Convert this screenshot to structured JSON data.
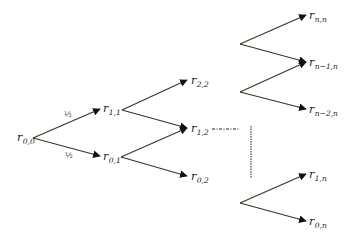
{
  "diagram": {
    "nodes": [
      {
        "id": "r00",
        "base": "r",
        "sub": "0,0",
        "x": 17,
        "y": 141
      },
      {
        "id": "r11",
        "base": "r",
        "sub": "1,1",
        "x": 103,
        "y": 112
      },
      {
        "id": "r01",
        "base": "r",
        "sub": "0,1",
        "x": 103,
        "y": 160
      },
      {
        "id": "r22",
        "base": "r",
        "sub": "2,2",
        "x": 191,
        "y": 84
      },
      {
        "id": "r12",
        "base": "r",
        "sub": "1,2",
        "x": 191,
        "y": 132
      },
      {
        "id": "r02",
        "base": "r",
        "sub": "0,2",
        "x": 191,
        "y": 180
      },
      {
        "id": "rnn",
        "base": "r",
        "sub": "n,n",
        "x": 309,
        "y": 19
      },
      {
        "id": "rn1n",
        "base": "r",
        "sub": "n−1,n",
        "x": 309,
        "y": 66
      },
      {
        "id": "rn2n",
        "base": "r",
        "sub": "n−2,n",
        "x": 309,
        "y": 113
      },
      {
        "id": "r1n",
        "base": "r",
        "sub": "1,n",
        "x": 309,
        "y": 178
      },
      {
        "id": "r0n",
        "base": "r",
        "sub": "0,n",
        "x": 309,
        "y": 225
      }
    ],
    "probabilities": [
      {
        "label": "½",
        "x": 64,
        "y": 117
      },
      {
        "label": "½",
        "x": 65,
        "y": 158
      }
    ],
    "edges": [
      {
        "x1": 33,
        "y1": 138,
        "x2": 100,
        "y2": 109
      },
      {
        "x1": 33,
        "y1": 138,
        "x2": 100,
        "y2": 156
      },
      {
        "x1": 122,
        "y1": 110,
        "x2": 187,
        "y2": 80
      },
      {
        "x1": 122,
        "y1": 110,
        "x2": 187,
        "y2": 128
      },
      {
        "x1": 121,
        "y1": 157,
        "x2": 187,
        "y2": 128
      },
      {
        "x1": 121,
        "y1": 157,
        "x2": 187,
        "y2": 176
      },
      {
        "x1": 240,
        "y1": 44,
        "x2": 306,
        "y2": 15
      },
      {
        "x1": 240,
        "y1": 44,
        "x2": 306,
        "y2": 62
      },
      {
        "x1": 240,
        "y1": 92,
        "x2": 306,
        "y2": 62
      },
      {
        "x1": 240,
        "y1": 92,
        "x2": 306,
        "y2": 109
      },
      {
        "x1": 240,
        "y1": 203,
        "x2": 306,
        "y2": 174
      },
      {
        "x1": 240,
        "y1": 203,
        "x2": 306,
        "y2": 221
      }
    ],
    "ellipsis": {
      "horizontal": {
        "x1": 212,
        "y1": 129,
        "x2": 240,
        "y2": 129
      },
      "vertical": {
        "x1": 251,
        "y1": 126,
        "x2": 251,
        "y2": 178
      }
    },
    "colors": {
      "edge": "#3a3325",
      "text": "#222222"
    }
  }
}
